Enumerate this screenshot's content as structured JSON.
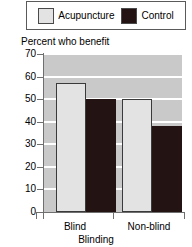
{
  "legend": {
    "position": "top",
    "entries": [
      {
        "label": "Acupuncture",
        "color": "#e3e3e3",
        "swatch_name": "legend-swatch-acupuncture"
      },
      {
        "label": "Control",
        "color": "#231413",
        "swatch_name": "legend-swatch-control"
      }
    ]
  },
  "chart_data": {
    "type": "bar",
    "title": "Percent who benefit",
    "xlabel": "Blinding",
    "ylabel": "Percent who benefit",
    "categories": [
      "Blind",
      "Non-blind"
    ],
    "series": [
      {
        "name": "Acupuncture",
        "color": "#e3e3e3",
        "values": [
          57,
          50
        ]
      },
      {
        "name": "Control",
        "color": "#231413",
        "values": [
          50,
          38
        ]
      }
    ],
    "ylim": [
      0,
      70
    ],
    "yticks": [
      0,
      10,
      20,
      30,
      40,
      50,
      60,
      70
    ],
    "ytick_labels": [
      "0",
      "10",
      "20",
      "30",
      "40",
      "50",
      "60",
      "70"
    ],
    "grid": true,
    "grid_color": "#ffffff",
    "plot_background": "#c9c9c9",
    "legend_position": "top"
  },
  "colors": {
    "acupuncture": "#e3e3e3",
    "control": "#231413",
    "plot_bg": "#c9c9c9",
    "gridline": "#ffffff",
    "axis": "#6f6f6f"
  }
}
